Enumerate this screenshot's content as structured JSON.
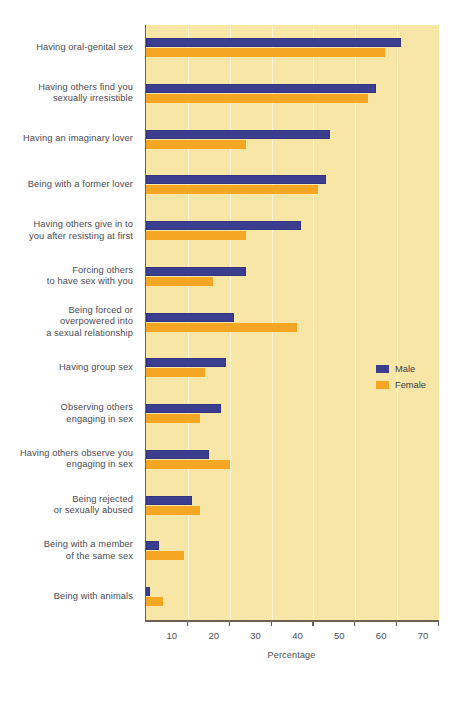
{
  "chart_data": {
    "type": "bar",
    "orientation": "horizontal",
    "title": "",
    "xlabel": "Percentage",
    "ylabel": "",
    "xlim": [
      0,
      70
    ],
    "xticks": [
      10,
      20,
      30,
      40,
      50,
      60,
      70
    ],
    "grid": true,
    "legend_position": "middle-right",
    "categories": [
      "Having oral-genital sex",
      "Having others find you\nsexually irresistible",
      "Having an imaginary lover",
      "Being with a former lover",
      "Having others give in to\nyou after resisting at first",
      "Forcing others\nto have sex with you",
      "Being forced or\noverpowered into\na sexual relationship",
      "Having group sex",
      "Observing others\nengaging in sex",
      "Having others observe you\nengaging in sex",
      "Being rejected\nor sexually abused",
      "Being with a member\nof the same sex",
      "Being with animals"
    ],
    "series": [
      {
        "name": "Male",
        "color": "#3b3d8f",
        "values": [
          61,
          55,
          44,
          43,
          37,
          24,
          21,
          19,
          18,
          15,
          11,
          3,
          1
        ]
      },
      {
        "name": "Female",
        "color": "#f5a623",
        "values": [
          57,
          53,
          24,
          41,
          24,
          16,
          36,
          14,
          13,
          20,
          13,
          9,
          4
        ]
      }
    ],
    "plot_background_color": "#f7e6a6",
    "page_background_color": "#ffffff"
  },
  "legend": {
    "items": [
      {
        "label": "Male",
        "color": "#3b3d8f"
      },
      {
        "label": "Female",
        "color": "#f5a623"
      }
    ]
  },
  "axis": {
    "x_title": "Percentage",
    "tick_labels": [
      "10",
      "20",
      "30",
      "40",
      "50",
      "60",
      "70"
    ]
  }
}
